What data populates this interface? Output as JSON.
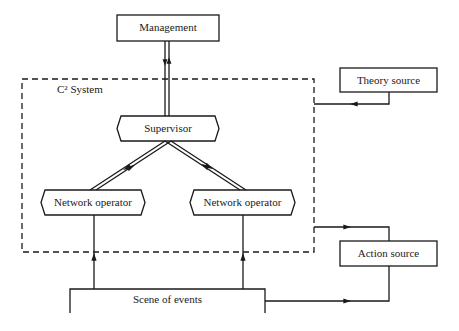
{
  "diagram": {
    "colors": {
      "stroke": "#1a1a1a",
      "background": "#ffffff"
    },
    "nodes": {
      "management": {
        "label": "Management",
        "shape": "rectangle"
      },
      "system_boundary": {
        "label": "C² System",
        "shape": "dashed-rectangle"
      },
      "supervisor": {
        "label": "Supervisor",
        "shape": "hexagon"
      },
      "network_operator_left": {
        "label": "Network operator",
        "shape": "hexagon"
      },
      "network_operator_right": {
        "label": "Network operator",
        "shape": "hexagon"
      },
      "theory_source": {
        "label": "Theory source",
        "shape": "rectangle"
      },
      "action_source": {
        "label": "Action source",
        "shape": "rectangle"
      },
      "scene_of_events": {
        "label": "Scene of events",
        "shape": "open-rectangle"
      }
    },
    "edges": [
      {
        "from": "supervisor",
        "to": "management",
        "style": "double",
        "direction": "bidirectional"
      },
      {
        "from": "supervisor",
        "to": "network_operator_left",
        "style": "double",
        "direction": "bidirectional"
      },
      {
        "from": "supervisor",
        "to": "network_operator_right",
        "style": "double",
        "direction": "bidirectional"
      },
      {
        "from": "scene_of_events",
        "to": "network_operator_left",
        "style": "single",
        "direction": "forward"
      },
      {
        "from": "scene_of_events",
        "to": "network_operator_right",
        "style": "single",
        "direction": "forward"
      },
      {
        "from": "theory_source",
        "to": "system_boundary",
        "style": "single",
        "direction": "forward"
      },
      {
        "from": "system_boundary",
        "to": "action_source",
        "style": "single",
        "direction": "forward"
      },
      {
        "from": "scene_of_events",
        "to": "action_source",
        "style": "single",
        "direction": "forward"
      }
    ]
  }
}
